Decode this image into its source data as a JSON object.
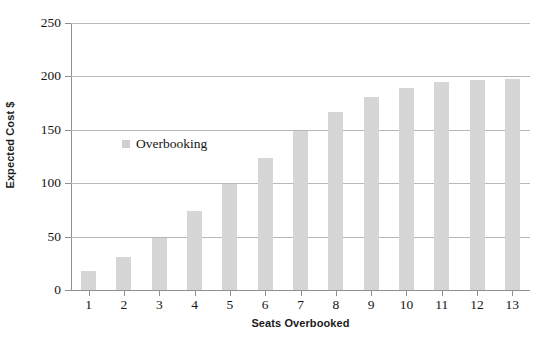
{
  "chart_data": {
    "type": "bar",
    "title": "",
    "xlabel": "Seats Overbooked",
    "ylabel": "Expected Cost $",
    "categories": [
      "1",
      "2",
      "3",
      "4",
      "5",
      "6",
      "7",
      "8",
      "9",
      "10",
      "11",
      "12",
      "13"
    ],
    "values": [
      18,
      31,
      49,
      74,
      99,
      124,
      149,
      167,
      181,
      189,
      195,
      197,
      198
    ],
    "series": [
      {
        "name": "Overbooking",
        "values": [
          18,
          31,
          49,
          74,
          99,
          124,
          149,
          167,
          181,
          189,
          195,
          197,
          198
        ]
      }
    ],
    "ylim": [
      0,
      250
    ],
    "yticks": [
      0,
      50,
      100,
      150,
      200,
      250
    ],
    "ytick_labels": [
      "0",
      "50",
      "100",
      "150",
      "200",
      "250"
    ],
    "xtick_labels": [
      "1",
      "2",
      "3",
      "4",
      "5",
      "6",
      "7",
      "8",
      "9",
      "10",
      "11",
      "12",
      "13"
    ],
    "grid": "horizontal",
    "legend": {
      "position": "inside-upper-left",
      "entries": [
        {
          "label": "Overbooking",
          "color": "#cfcfcf"
        }
      ]
    },
    "colors": {
      "bar": "#d6d6d6",
      "gridline": "#b7b7b7",
      "axis": "#8f8f8f",
      "text": "#141414",
      "background": "#ffffff"
    }
  }
}
